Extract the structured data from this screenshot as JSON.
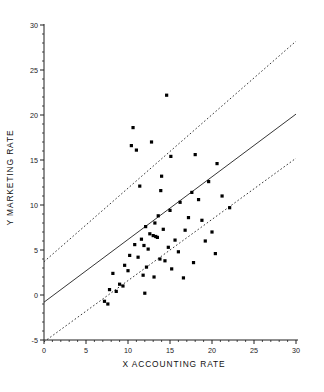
{
  "chart_data": {
    "type": "scatter",
    "title": "",
    "xlabel": "X  ACCOUNTING RATE",
    "ylabel": "Y MARKETING RATE",
    "xlim": [
      0,
      30
    ],
    "ylim": [
      -5,
      30
    ],
    "xticks": [
      0,
      5,
      10,
      15,
      20,
      25,
      30
    ],
    "yticks": [
      -5,
      0,
      5,
      10,
      15,
      20,
      25,
      30
    ],
    "xtick_labels": [
      "0",
      "5",
      "10",
      "15",
      "20",
      "25",
      "30"
    ],
    "ytick_labels": [
      "-5",
      "0",
      "5",
      "10",
      "15",
      "20",
      "25",
      "30"
    ],
    "grid": false,
    "legend": null,
    "marker": "filled-square",
    "marker_color": "#000000",
    "points": [
      [
        14.6,
        22.2
      ],
      [
        10.6,
        18.6
      ],
      [
        12.8,
        17.0
      ],
      [
        10.4,
        16.6
      ],
      [
        11.0,
        16.1
      ],
      [
        18.0,
        15.6
      ],
      [
        15.1,
        15.4
      ],
      [
        20.6,
        14.6
      ],
      [
        11.4,
        12.1
      ],
      [
        13.9,
        11.6
      ],
      [
        17.6,
        11.4
      ],
      [
        18.4,
        10.6
      ],
      [
        16.2,
        10.3
      ],
      [
        22.1,
        9.7
      ],
      [
        15.0,
        9.4
      ],
      [
        13.6,
        8.8
      ],
      [
        17.2,
        8.6
      ],
      [
        18.8,
        8.3
      ],
      [
        13.2,
        8.0
      ],
      [
        12.1,
        7.6
      ],
      [
        14.2,
        7.3
      ],
      [
        16.8,
        7.2
      ],
      [
        20.0,
        7.0
      ],
      [
        12.6,
        6.8
      ],
      [
        13.0,
        6.6
      ],
      [
        13.3,
        6.5
      ],
      [
        13.5,
        6.4
      ],
      [
        11.6,
        6.2
      ],
      [
        15.6,
        6.1
      ],
      [
        19.2,
        6.0
      ],
      [
        10.8,
        5.6
      ],
      [
        11.9,
        5.5
      ],
      [
        14.8,
        5.3
      ],
      [
        12.4,
        5.1
      ],
      [
        16.0,
        4.8
      ],
      [
        20.4,
        4.6
      ],
      [
        10.2,
        4.4
      ],
      [
        11.2,
        4.2
      ],
      [
        13.8,
        4.0
      ],
      [
        14.4,
        3.8
      ],
      [
        17.8,
        3.6
      ],
      [
        9.6,
        3.3
      ],
      [
        12.2,
        3.1
      ],
      [
        15.2,
        2.9
      ],
      [
        10.0,
        2.7
      ],
      [
        8.2,
        2.4
      ],
      [
        11.8,
        2.2
      ],
      [
        13.1,
        2.0
      ],
      [
        16.6,
        1.9
      ],
      [
        9.0,
        1.2
      ],
      [
        9.4,
        1.0
      ],
      [
        7.8,
        0.6
      ],
      [
        8.6,
        0.4
      ],
      [
        12.0,
        0.2
      ],
      [
        7.2,
        -0.7
      ],
      [
        7.6,
        -1.0
      ],
      [
        14.0,
        13.2
      ],
      [
        19.6,
        12.6
      ],
      [
        21.2,
        11.0
      ]
    ],
    "lines": [
      {
        "name": "regression-line",
        "style": "solid",
        "x": [
          0,
          30
        ],
        "y": [
          -0.8,
          20.1
        ]
      },
      {
        "name": "upper-confidence-band",
        "style": "dashed",
        "x": [
          0,
          30
        ],
        "y": [
          3.7,
          28.2
        ]
      },
      {
        "name": "lower-confidence-band",
        "style": "dashed",
        "x": [
          0,
          30
        ],
        "y": [
          -5.2,
          15.2
        ]
      }
    ]
  }
}
